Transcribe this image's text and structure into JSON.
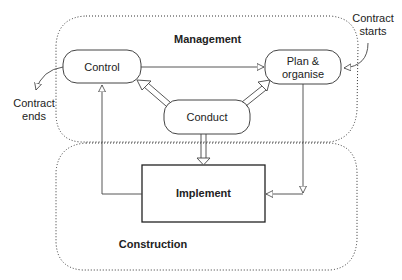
{
  "regions": {
    "management": "Management",
    "construction": "Construction"
  },
  "nodes": {
    "control": "Control",
    "plan_line1": "Plan &",
    "plan_line2": "organise",
    "conduct": "Conduct",
    "implement": "Implement"
  },
  "annotations": {
    "contract_starts_line1": "Contract",
    "contract_starts_line2": "starts",
    "contract_ends_line1": "Contract",
    "contract_ends_line2": "ends"
  },
  "colors": {
    "line": "#444444",
    "dotted": "#333333",
    "text": "#222222"
  }
}
